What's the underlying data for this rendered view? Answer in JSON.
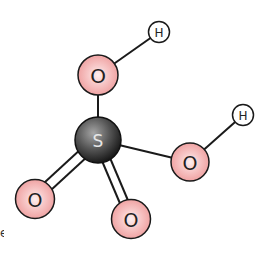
{
  "diagram": {
    "colors": {
      "sulfur_fill_light": "#9a9a9a",
      "sulfur_fill_dark": "#1e1e1e",
      "oxygen_fill_light": "#fbe6e6",
      "oxygen_fill": "#f0a5a5",
      "hydrogen_fill": "#ffffff",
      "stroke": "#1a1a1a"
    },
    "atoms": [
      {
        "id": "S",
        "label": "S",
        "element": "sulfur"
      },
      {
        "id": "O1",
        "label": "O",
        "element": "oxygen",
        "position": "top"
      },
      {
        "id": "H1",
        "label": "H",
        "element": "hydrogen",
        "position": "top-right"
      },
      {
        "id": "O2",
        "label": "O",
        "element": "oxygen",
        "position": "right"
      },
      {
        "id": "H2",
        "label": "H",
        "element": "hydrogen",
        "position": "far-right"
      },
      {
        "id": "O3",
        "label": "O",
        "element": "oxygen",
        "position": "bottom-left"
      },
      {
        "id": "O4",
        "label": "O",
        "element": "oxygen",
        "position": "bottom"
      }
    ],
    "bonds": [
      {
        "from": "S",
        "to": "O1",
        "order": 1
      },
      {
        "from": "O1",
        "to": "H1",
        "order": 1
      },
      {
        "from": "S",
        "to": "O2",
        "order": 1
      },
      {
        "from": "O2",
        "to": "H2",
        "order": 1
      },
      {
        "from": "S",
        "to": "O3",
        "order": 2
      },
      {
        "from": "S",
        "to": "O4",
        "order": 2
      }
    ],
    "edge_fragment": "e"
  }
}
